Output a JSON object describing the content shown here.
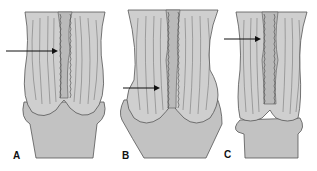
{
  "figure": {
    "panels": [
      {
        "label": "A"
      },
      {
        "label": "B"
      },
      {
        "label": "C"
      }
    ],
    "colors": {
      "fill": "#c8c8c8",
      "fill_dark": "#bdbdbd",
      "stroke": "#555555",
      "arrow": "#111111",
      "background": "#ffffff"
    }
  }
}
